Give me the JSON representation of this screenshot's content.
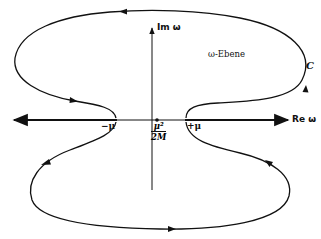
{
  "figure": {
    "axes": {
      "real_label": "Re ω",
      "imag_label": "Im ω"
    },
    "region_label": "ω-Ebene",
    "contour_label": "C",
    "points": {
      "minus_mu": "−μ",
      "plus_mu": "+μ",
      "origin_fraction": {
        "numerator": "μ²",
        "denominator": "2M"
      }
    },
    "colors": {
      "ink": "#111111",
      "background": "#ffffff"
    }
  }
}
